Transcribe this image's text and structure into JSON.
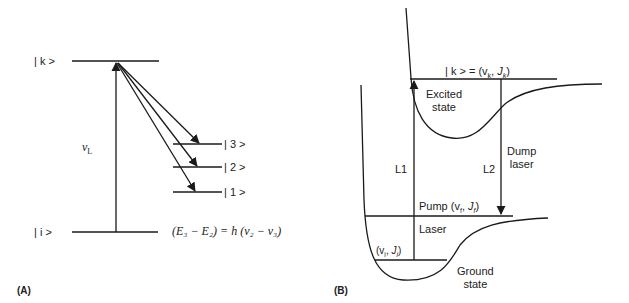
{
  "panel_a": {
    "panel_label": "(A)",
    "levels": {
      "k": {
        "label": "| k >"
      },
      "i": {
        "label": "| i >"
      },
      "three": {
        "label": "| 3 >"
      },
      "two": {
        "label": "| 2 >"
      },
      "one": {
        "label": "| 1 >"
      }
    },
    "excitation_label": "ν",
    "excitation_sub": "L",
    "equation": "(E₃ − E₂) = h (ν₂ − ν₃)"
  },
  "panel_b": {
    "panel_label": "(B)",
    "upper_level_label": "| k > = (v",
    "upper_level_k": "k",
    "upper_level_J": "J",
    "excited_state": [
      "Excited",
      "state"
    ],
    "ground_state": [
      "Ground",
      "state"
    ],
    "l1": "L1",
    "l2": "L2",
    "dump_laser": [
      "Dump",
      "laser"
    ],
    "pump_label": "Pump (v",
    "pump_sub": "f",
    "laser_label": "Laser",
    "initial_level": "(v",
    "initial_sub": "i"
  },
  "colors": {
    "line": "#1a1a1a",
    "background": "#ffffff"
  }
}
